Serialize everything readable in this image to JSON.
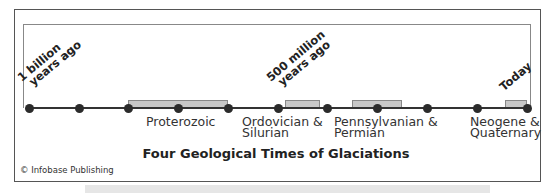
{
  "title": "Four Geological Times of Glaciations",
  "credit": "© Infobase Publishing",
  "markers": {
    "start": [
      "1 billion",
      "years ago"
    ],
    "middle": [
      "500 million",
      "years ago"
    ],
    "end": "Today"
  },
  "periods": [
    {
      "line1": "Proterozoic",
      "line2": ""
    },
    {
      "line1": "Ordovician &",
      "line2": "Silurian"
    },
    {
      "line1": "Pennsylvanian &",
      "line2": "Permian"
    },
    {
      "line1": "Neogene &",
      "line2": "Quaternary"
    }
  ],
  "timeline": {
    "ticks": 11,
    "dot_color": "#2b2b2b",
    "bar_color": "#c8c8c8"
  }
}
